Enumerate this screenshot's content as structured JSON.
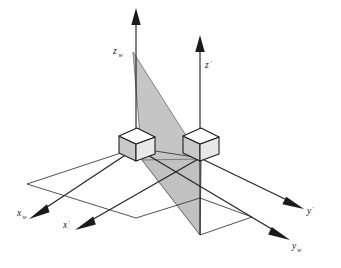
{
  "figure": {
    "background_color": "#fefefe",
    "ink_color": "#1a1a1a",
    "shade_color": "#c0c0c0",
    "cube_top_color": "#ffffff",
    "cube_left_color": "#c9c9c9",
    "cube_right_color": "#e8e8e8"
  },
  "axes": [
    {
      "id": "z-world",
      "label": "z",
      "subscript": "w",
      "prime": "",
      "direction": "up",
      "label_x": 113,
      "label_y": 54,
      "sub_dx": 5.4,
      "sub_dy": 2.6
    },
    {
      "id": "z-prime",
      "label": "z",
      "subscript": "",
      "prime": "′",
      "direction": "up",
      "label_x": 205,
      "label_y": 68,
      "sub_dx": 5.2,
      "sub_dy": -3.4
    },
    {
      "id": "x-world",
      "label": "x",
      "subscript": "w",
      "prime": "",
      "direction": "lower-left",
      "label_x": 17,
      "label_y": 216,
      "sub_dx": 5.4,
      "sub_dy": 2.6
    },
    {
      "id": "x-prime",
      "label": "x",
      "subscript": "",
      "prime": "′",
      "direction": "lower-left",
      "label_x": 63,
      "label_y": 228,
      "sub_dx": 5.2,
      "sub_dy": -3.4
    },
    {
      "id": "y-prime",
      "label": "y",
      "subscript": "",
      "prime": "′",
      "direction": "lower-right",
      "label_x": 307,
      "label_y": 214,
      "sub_dx": 5.0,
      "sub_dy": -3.4
    },
    {
      "id": "y-world",
      "label": "y",
      "subscript": "w",
      "prime": "",
      "direction": "lower-right",
      "label_x": 292,
      "label_y": 249,
      "sub_dx": 5.2,
      "sub_dy": 2.6
    }
  ],
  "origins": [
    {
      "id": "world-origin",
      "x": 136,
      "y": 148
    },
    {
      "id": "prime-origin",
      "x": 200,
      "y": 158
    }
  ],
  "cubes": [
    {
      "id": "world-cube",
      "center_x": 136,
      "center_y": 144,
      "size": 17
    },
    {
      "id": "prime-cube",
      "center_x": 200,
      "center_y": 144,
      "size": 17
    }
  ],
  "shaded_plane": {
    "id": "transform-plane",
    "points": "133,52 201,159 200,235 144,161",
    "fill": "#c0c0c0"
  }
}
